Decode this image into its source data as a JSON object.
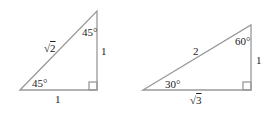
{
  "diagram": {
    "colors": {
      "stroke": "#999999",
      "text": "#222222"
    },
    "triangle_45": {
      "hypotenuse": "√2",
      "hyp_radicand": "2",
      "top_angle": "45°",
      "bottom_angle": "45°",
      "vertical_leg": "1",
      "horizontal_leg": "1"
    },
    "triangle_30_60": {
      "hypotenuse": "2",
      "top_angle": "60°",
      "bottom_angle": "30°",
      "vertical_leg": "1",
      "horizontal_leg": "√3",
      "horiz_radicand": "3"
    }
  }
}
